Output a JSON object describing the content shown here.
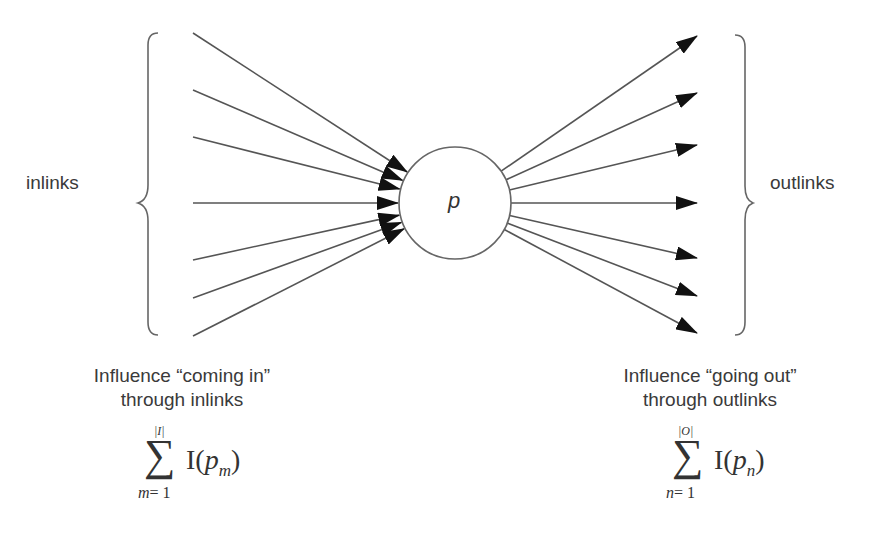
{
  "diagram": {
    "node": {
      "label": "p",
      "cx": 455,
      "cy": 203,
      "r": 56
    },
    "left_label": "inlinks",
    "right_label": "outlinks",
    "inlinks_start_y": [
      33,
      90,
      137,
      203,
      260,
      298,
      336
    ],
    "outlinks_end_y": [
      36,
      93,
      145,
      203,
      258,
      296,
      333
    ],
    "left_caption": {
      "line1": "Influence “coming in”",
      "line2": "through inlinks"
    },
    "right_caption": {
      "line1": "Influence “going out”",
      "line2": "through outlinks"
    },
    "left_formula": {
      "upper": "|I|",
      "lower_var": "m",
      "lower_eq": "= 1",
      "func": "I(",
      "arg": "p",
      "arg_sub": "m",
      "close": ")"
    },
    "right_formula": {
      "upper": "|O|",
      "lower_var": "n",
      "lower_eq": "= 1",
      "func": "I(",
      "arg": "p",
      "arg_sub": "n",
      "close": ")"
    },
    "colors": {
      "line": "#555555",
      "arrowhead": "#111111",
      "text": "#3a3a3a"
    }
  }
}
